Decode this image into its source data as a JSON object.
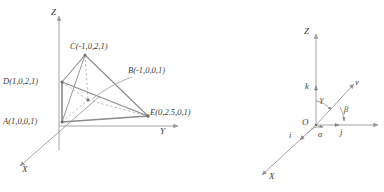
{
  "figure_left": {
    "name": "polyhedron-coordinate-diagram",
    "axes": [
      {
        "id": "z",
        "label": "Z"
      },
      {
        "id": "y",
        "label": "Y"
      },
      {
        "id": "x",
        "label": "X"
      }
    ],
    "vertices": [
      {
        "id": "C",
        "label": "C(-1,0,2,1)",
        "x": 85,
        "y": 55
      },
      {
        "id": "B",
        "label": "B(-1,0,0,1)",
        "x": 88,
        "y": 100
      },
      {
        "id": "D",
        "label": "D(1,0,2,1)",
        "x": 62,
        "y": 82
      },
      {
        "id": "A",
        "label": "A(1,0,0,1)",
        "x": 62,
        "y": 122
      },
      {
        "id": "E",
        "label": "E(0,2.5,0,1)",
        "x": 148,
        "y": 116
      }
    ],
    "colors": {
      "stroke": "#8a8a8a",
      "axis": "#9a9a9a",
      "text": "#3d3d3d"
    }
  },
  "figure_right": {
    "name": "direction-cosines-diagram",
    "axes": [
      {
        "id": "z",
        "label": "Z"
      },
      {
        "id": "x",
        "label": "X"
      }
    ],
    "origin_label": "O",
    "vectors": [
      {
        "id": "k",
        "label": "k"
      },
      {
        "id": "i",
        "label": "i"
      },
      {
        "id": "j",
        "label": "j"
      },
      {
        "id": "v",
        "label": "v"
      }
    ],
    "angles": [
      {
        "id": "alpha",
        "label": "α"
      },
      {
        "id": "beta",
        "label": "β"
      },
      {
        "id": "gamma",
        "label": "γ"
      }
    ],
    "colors": {
      "stroke": "#8a8a8a",
      "axis": "#9a9a9a",
      "text": "#3d3d3d"
    }
  }
}
